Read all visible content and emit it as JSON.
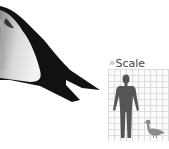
{
  "scale": {
    "icon": "double-chevron-right-icon",
    "chevron_glyph": "»",
    "title": "Scale"
  },
  "images": {
    "bird_tail": "bird-tail-closeup",
    "human_silhouette": "human-silhouette",
    "bird_silhouette": "duck-silhouette"
  },
  "colors": {
    "silhouette": "#555555",
    "grid_line": "#dcdcdc",
    "chevron": "#b5b5b5",
    "title_text": "#444444"
  }
}
